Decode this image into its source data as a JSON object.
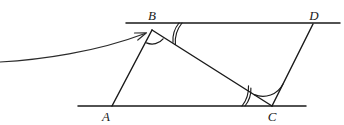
{
  "figure": {
    "kind": "geometry-diagram",
    "background_color": "#ffffff",
    "ink_color": "#1a1a1a",
    "pointer_color": "#2b2b2b",
    "canvas": {
      "width": 344,
      "height": 125
    },
    "labels": [
      {
        "name": "vertex-label-b",
        "text": "B",
        "x": 152,
        "y": 20
      },
      {
        "name": "vertex-label-d",
        "text": "D",
        "x": 314,
        "y": 20
      },
      {
        "name": "vertex-label-a",
        "text": "A",
        "x": 106,
        "y": 121
      },
      {
        "name": "vertex-label-c",
        "text": "C",
        "x": 272,
        "y": 121
      }
    ],
    "points": {
      "A": {
        "x": 112,
        "y": 106
      },
      "B": {
        "x": 152,
        "y": 30
      },
      "C": {
        "x": 272,
        "y": 106
      },
      "D": {
        "x": 313,
        "y": 24
      }
    },
    "segments": [
      {
        "name": "top-parallel-line",
        "x1": 126,
        "y1": 23,
        "x2": 340,
        "y2": 23
      },
      {
        "name": "bottom-parallel-line",
        "x1": 78,
        "y1": 106,
        "x2": 306,
        "y2": 106
      },
      {
        "name": "segment-ab",
        "x1": 112,
        "y1": 106,
        "x2": 152,
        "y2": 30
      },
      {
        "name": "segment-bc",
        "x1": 152,
        "y1": 30,
        "x2": 272,
        "y2": 106
      },
      {
        "name": "segment-cd",
        "x1": 272,
        "y1": 106,
        "x2": 313,
        "y2": 24
      }
    ],
    "angle_marks": [
      {
        "name": "angle-mark-abc-single",
        "arcs": 1,
        "at": "B",
        "note": "single arc inside angle ABC"
      },
      {
        "name": "angle-mark-dbc-double",
        "arcs": 2,
        "at": "B",
        "note": "double arc inside angle DBC"
      },
      {
        "name": "angle-mark-bca-double",
        "arcs": 2,
        "at": "C",
        "note": "double arc inside angle BCA"
      },
      {
        "name": "angle-mark-bcd-single",
        "arcs": 1,
        "at": "C",
        "note": "single arc inside angle BCD"
      }
    ],
    "pointer": {
      "name": "annotation-arrow",
      "points_to": "B",
      "tip": {
        "x": 146,
        "y": 33
      },
      "from": {
        "x": 0,
        "y": 60
      }
    }
  }
}
